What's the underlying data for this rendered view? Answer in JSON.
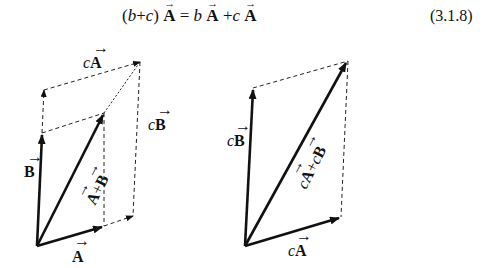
{
  "equation": {
    "text": "(b + c) A⃗ = b A⃗ + c A⃗",
    "number": "(3.1.8)"
  },
  "figures": [
    {
      "id": "left",
      "labels": {
        "A": "A",
        "B": "B",
        "sum": "A+B",
        "cA": "cA",
        "cB": "cB"
      }
    },
    {
      "id": "right",
      "labels": {
        "cA": "cA",
        "cB": "cB",
        "sum": "cA+cB"
      }
    }
  ]
}
